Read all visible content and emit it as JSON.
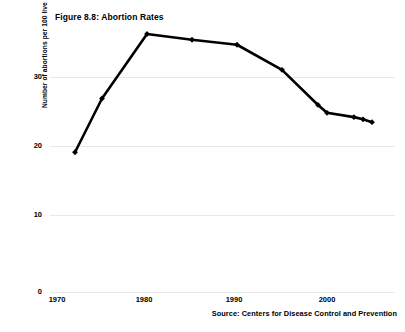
{
  "chart_data": {
    "type": "line",
    "title": "Figure 8.8: Abortion Rates",
    "xlabel": "",
    "ylabel": "Number of abortions per 100 live births",
    "source": "Source: Centers for Disease Control and Prevention",
    "xlim": [
      1970,
      2006
    ],
    "ylim": [
      0,
      37
    ],
    "grid": true,
    "legend": null,
    "y_ticks": [
      0,
      10,
      20,
      30
    ],
    "y_tick_labels": [
      "0",
      "10",
      "20",
      "30"
    ],
    "x_ticks": [
      1970,
      1980,
      1990,
      2000
    ],
    "x_tick_labels": [
      "1970",
      "1980",
      "1990",
      "2000"
    ],
    "marker": "diamond",
    "line_color": "#000000",
    "x": [
      1972,
      1975,
      1980,
      1985,
      1990,
      1995,
      1999,
      2000,
      2003,
      2004,
      2005
    ],
    "values": [
      19.5,
      27.0,
      36.0,
      35.2,
      34.5,
      31.0,
      26.1,
      25.0,
      24.4,
      24.1,
      23.7
    ],
    "series": [
      {
        "name": "Abortion rate",
        "values": [
          19.5,
          27.0,
          36.0,
          35.2,
          34.5,
          31.0,
          26.1,
          25.0,
          24.4,
          24.1,
          23.7
        ]
      }
    ]
  }
}
